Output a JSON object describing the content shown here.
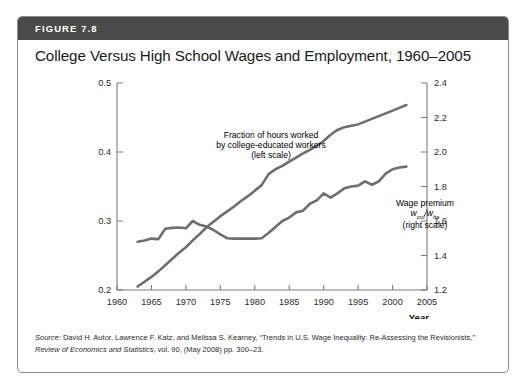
{
  "figure": {
    "number_label": "FIGURE 7.8",
    "title": "College Versus High School Wages and Employment, 1960–2005",
    "header_color": "#4a4a4a",
    "line_color": "#6e6e6e"
  },
  "source": {
    "prefix": "Source:",
    "authors": " David H. Autor, Lawrence F. Katz, and Melissa S. Kearney, “Trends in U.S. Wage Inequality: Re-Assessing the Revisionists,” ",
    "journal": "Review of Economics and Statistics",
    "citation": ", vol. 90, (May 2008) pp. 300–23."
  },
  "annotations": {
    "fraction": {
      "line1": "Fraction of hours worked",
      "line2": "by college-educated workers",
      "line3": "(left scale)"
    },
    "premium": {
      "line1": "Wage premium",
      "symbol_num": "w",
      "symbol_num_sub": "col",
      "symbol_slash": "/",
      "symbol_den": "w",
      "symbol_den_sub": "hs",
      "line3": "(right scale)"
    }
  },
  "chart_data": {
    "type": "line",
    "title": "College Versus High School Wages and Employment, 1960–2005",
    "xlabel": "Year",
    "xlim": [
      1960,
      2005
    ],
    "xticks": [
      1960,
      1965,
      1970,
      1975,
      1980,
      1985,
      1990,
      1995,
      2000,
      2005
    ],
    "grid": false,
    "legend": "inline-annotations",
    "left_axis": {
      "label": "Fraction of hours worked by college-educated workers",
      "ylim": [
        0.2,
        0.5
      ],
      "yticks": [
        0.2,
        0.3,
        0.4,
        0.5
      ]
    },
    "right_axis": {
      "label": "Wage premium w_col/w_hs",
      "ylim": [
        1.2,
        2.4
      ],
      "yticks": [
        1.2,
        1.4,
        1.6,
        1.8,
        2.0,
        2.2,
        2.4
      ]
    },
    "series": [
      {
        "name": "Fraction of hours worked by college-educated workers (left scale)",
        "axis": "left",
        "x": [
          1963,
          1964,
          1965,
          1966,
          1967,
          1968,
          1969,
          1970,
          1971,
          1972,
          1973,
          1974,
          1975,
          1976,
          1977,
          1978,
          1979,
          1980,
          1981,
          1982,
          1983,
          1984,
          1985,
          1986,
          1987,
          1988,
          1989,
          1990,
          1991,
          1992,
          1993,
          1994,
          1995,
          1996,
          1997,
          1998,
          1999,
          2000,
          2001,
          2002
        ],
        "y": [
          0.205,
          0.212,
          0.219,
          0.227,
          0.236,
          0.245,
          0.254,
          0.262,
          0.272,
          0.281,
          0.291,
          0.299,
          0.307,
          0.314,
          0.321,
          0.329,
          0.336,
          0.344,
          0.352,
          0.368,
          0.375,
          0.38,
          0.386,
          0.392,
          0.398,
          0.403,
          0.409,
          0.416,
          0.425,
          0.432,
          0.436,
          0.438,
          0.44,
          0.444,
          0.448,
          0.452,
          0.456,
          0.46,
          0.464,
          0.468
        ]
      },
      {
        "name": "Wage premium w_col/w_hs (right scale)",
        "axis": "right",
        "x": [
          1963,
          1964,
          1965,
          1966,
          1967,
          1968,
          1969,
          1970,
          1971,
          1972,
          1973,
          1974,
          1975,
          1976,
          1977,
          1978,
          1979,
          1980,
          1981,
          1982,
          1983,
          1984,
          1985,
          1986,
          1987,
          1988,
          1989,
          1990,
          1991,
          1992,
          1993,
          1994,
          1995,
          1996,
          1997,
          1998,
          1999,
          2000,
          2001,
          2002
        ],
        "y": [
          1.48,
          1.487,
          1.498,
          1.495,
          1.555,
          1.56,
          1.562,
          1.558,
          1.6,
          1.578,
          1.568,
          1.548,
          1.522,
          1.5,
          1.498,
          1.498,
          1.498,
          1.498,
          1.5,
          1.53,
          1.565,
          1.6,
          1.62,
          1.65,
          1.66,
          1.7,
          1.72,
          1.76,
          1.735,
          1.76,
          1.79,
          1.8,
          1.805,
          1.83,
          1.81,
          1.83,
          1.875,
          1.9,
          1.91,
          1.915
        ]
      }
    ]
  }
}
